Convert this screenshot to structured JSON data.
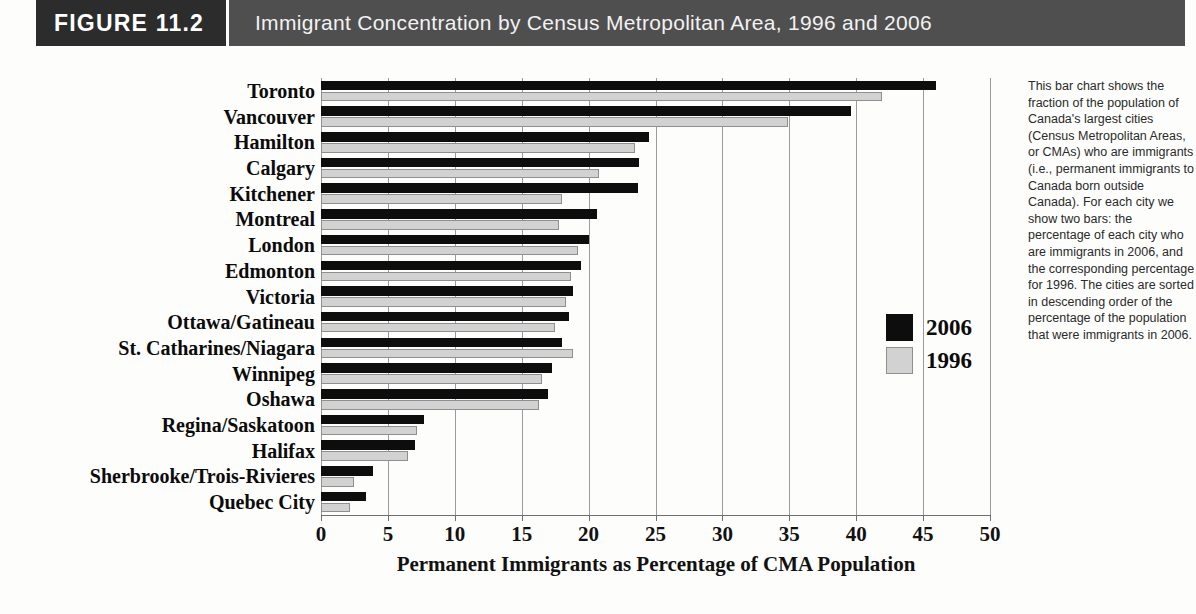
{
  "header": {
    "figure_tag": "FIGURE 11.2",
    "title": "Immigrant Concentration by Census Metropolitan Area, 1996 and 2006"
  },
  "legend": {
    "entries": [
      {
        "label": "2006",
        "color": "#0d0d0d",
        "swatch": "black-square"
      },
      {
        "label": "1996",
        "color": "#d2d2d2",
        "swatch": "gray-square"
      }
    ]
  },
  "side_caption": {
    "text": "This bar chart shows the fraction of the population of Canada's largest cities (Census Metropolitan Areas, or CMAs) who are immigrants (i.e., permanent immigrants to Canada born outside Canada). For each city we show two bars: the percentage of each city who are immigrants in 2006, and the corresponding percentage for 1996. The cities are sorted in descending order of the percentage of the population that were immigrants in 2006."
  },
  "chart_data": {
    "type": "bar",
    "orientation": "horizontal",
    "title": "Immigrant Concentration by Census Metropolitan Area, 1996 and 2006",
    "xlabel": "Permanent Immigrants as Percentage of CMA Population",
    "ylabel": "",
    "xlim": [
      0,
      50
    ],
    "xticks": [
      0,
      5,
      10,
      15,
      20,
      25,
      30,
      35,
      40,
      45,
      50
    ],
    "grid": true,
    "legend_position": "right",
    "categories": [
      "Toronto",
      "Vancouver",
      "Hamilton",
      "Calgary",
      "Kitchener",
      "Montreal",
      "London",
      "Edmonton",
      "Victoria",
      "Ottawa/Gatineau",
      "St. Catharines/Niagara",
      "Winnipeg",
      "Oshawa",
      "Regina/Saskatoon",
      "Halifax",
      "Sherbrooke/Trois-Rivieres",
      "Quebec City"
    ],
    "series": [
      {
        "name": "2006",
        "color": "#0d0d0d",
        "values": [
          46.0,
          39.6,
          24.5,
          23.8,
          23.7,
          20.6,
          20.0,
          19.4,
          18.8,
          18.5,
          18.0,
          17.3,
          17.0,
          7.7,
          7.0,
          3.9,
          3.4
        ]
      },
      {
        "name": "1996",
        "color": "#d2d2d2",
        "values": [
          41.9,
          34.9,
          23.5,
          20.8,
          18.0,
          17.8,
          19.2,
          18.7,
          18.3,
          17.5,
          18.8,
          16.5,
          16.3,
          7.2,
          6.5,
          2.5,
          2.2
        ]
      }
    ]
  }
}
